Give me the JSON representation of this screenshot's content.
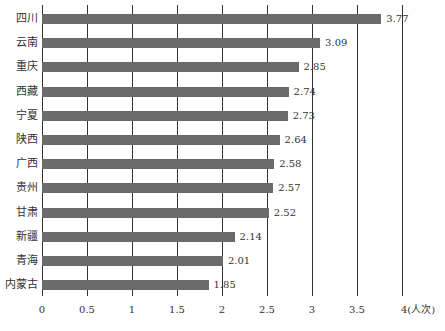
{
  "chart_data": {
    "type": "bar",
    "orientation": "horizontal",
    "title": "",
    "xlabel": "(人次)",
    "ylabel": "",
    "xlim": [
      0,
      4
    ],
    "x_ticks": [
      "0",
      "0.5",
      "1",
      "1.5",
      "2",
      "2.5",
      "3",
      "3.5",
      "4(人次)"
    ],
    "grid": "vertical lines at each tick",
    "categories": [
      "四川",
      "云南",
      "重庆",
      "西藏",
      "宁夏",
      "陕西",
      "广西",
      "贵州",
      "甘肃",
      "新疆",
      "青海",
      "内蒙古"
    ],
    "values": [
      3.77,
      3.09,
      2.85,
      2.74,
      2.73,
      2.64,
      2.58,
      2.57,
      2.52,
      2.14,
      2.01,
      1.85
    ],
    "value_labels": [
      "3.77",
      "3.09",
      "2.85",
      "2.74",
      "2.73",
      "2.64",
      "2.58",
      "2.57",
      "2.52",
      "2.14",
      "2.01",
      "1.85"
    ],
    "bar_color": "#6b6b6b"
  }
}
